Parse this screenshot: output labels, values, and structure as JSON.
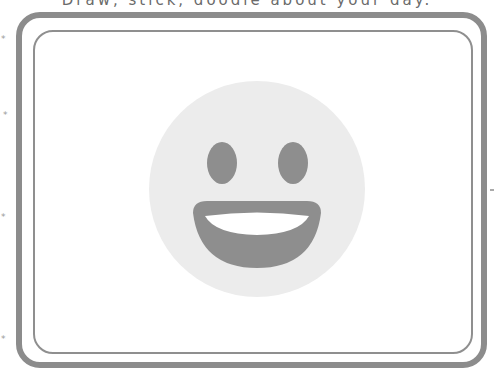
{
  "prompt": {
    "text": "Draw, stick, doodle about your day."
  },
  "frame": {
    "border_color": "#8c8c8c",
    "inner_border_color": "#8f8f8f"
  },
  "emoji": {
    "name": "grinning-face",
    "face_color": "#ececec",
    "feature_color": "#8e8e8e",
    "teeth_color": "#ffffff"
  },
  "decorations": {
    "stars": [
      "*",
      "*",
      "*",
      "*"
    ]
  }
}
